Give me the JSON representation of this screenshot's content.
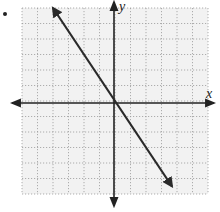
{
  "chart_data": {
    "type": "line",
    "title": "",
    "xlabel": "x",
    "ylabel": "y",
    "xlim": [
      -6,
      6
    ],
    "ylim": [
      -6,
      6
    ],
    "grid": true,
    "grid_style": "dotted",
    "legend": null,
    "series": [
      {
        "name": "line",
        "equation": "y = -1.5x",
        "slope": -1.5,
        "intercept": 0,
        "x": [
          -4,
          3.67
        ],
        "y": [
          6,
          -5.5
        ],
        "arrows": "both ends"
      }
    ]
  },
  "labels": {
    "x_axis": "x",
    "y_axis": "y"
  },
  "colors": {
    "grid": "#9a9a9a",
    "grid_background": "#f2f2f2",
    "axis": "#222222",
    "line": "#2a2a2a"
  }
}
